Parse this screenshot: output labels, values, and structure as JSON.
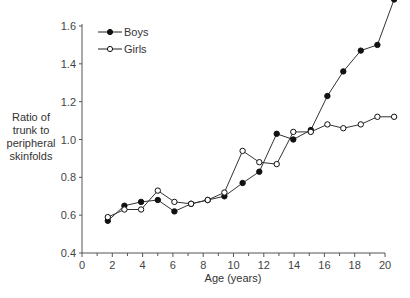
{
  "chart_data": {
    "type": "line",
    "title": "",
    "xlabel": "Age (years)",
    "ylabel": "Ratio of trunk to peripheral skinfolds",
    "ylabel_lines": [
      "Ratio of",
      "trunk to",
      "peripheral",
      "skinfolds"
    ],
    "xlim": [
      0,
      20
    ],
    "ylim": [
      0.4,
      1.6
    ],
    "xticks": [
      0,
      2,
      4,
      6,
      8,
      10,
      12,
      14,
      16,
      18,
      20
    ],
    "yticks": [
      "0.4",
      "0.6",
      "0.8",
      "1.0",
      "1.2",
      "1.4",
      "1.6"
    ],
    "grid": false,
    "legend_position": "upper-left",
    "series": [
      {
        "name": "Boys",
        "marker": "filled-circle",
        "color": "#111111",
        "x": [
          1.7,
          2.8,
          3.9,
          5.0,
          6.1,
          7.2,
          8.3,
          9.4,
          10.6,
          11.7,
          12.85,
          13.95,
          15.1,
          16.2,
          17.25,
          18.4,
          19.5,
          20.6
        ],
        "values": [
          0.57,
          0.65,
          0.67,
          0.68,
          0.62,
          0.66,
          0.68,
          0.7,
          0.77,
          0.83,
          1.03,
          1.0,
          1.05,
          1.23,
          1.36,
          1.47,
          1.5,
          1.74
        ]
      },
      {
        "name": "Girls",
        "marker": "open-circle",
        "color": "#111111",
        "x": [
          1.7,
          2.8,
          3.9,
          5.0,
          6.1,
          7.2,
          8.3,
          9.4,
          10.6,
          11.7,
          12.85,
          13.95,
          15.1,
          16.2,
          17.25,
          18.4,
          19.5,
          20.6
        ],
        "values": [
          0.59,
          0.63,
          0.63,
          0.73,
          0.67,
          0.66,
          0.68,
          0.72,
          0.94,
          0.88,
          0.87,
          1.04,
          1.04,
          1.08,
          1.06,
          1.08,
          1.12,
          1.12
        ]
      }
    ]
  },
  "legend": {
    "items": [
      {
        "label": "Boys",
        "marker": "filled-circle"
      },
      {
        "label": "Girls",
        "marker": "open-circle"
      }
    ]
  }
}
